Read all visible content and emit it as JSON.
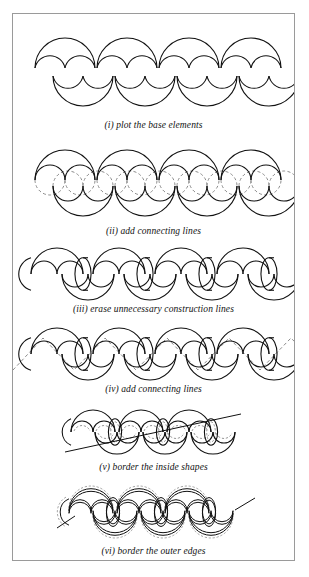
{
  "figure": {
    "background_color": "#ffffff",
    "border_color": "#9a9a9a",
    "solid_line_color": "#000000",
    "dashed_line_color": "#8c8c8c"
  },
  "steps": [
    {
      "id": "i",
      "caption": "(i) plot the base elements",
      "caption_y": 106,
      "panel_y": 16,
      "panel_h": 88,
      "description": "four arch elements on top row and four cup elements on lower row"
    },
    {
      "id": "ii",
      "caption": "(ii) add connecting lines",
      "caption_y": 212,
      "panel_y": 128,
      "panel_h": 82,
      "description": "circles completed with dashed construction arcs"
    },
    {
      "id": "iii",
      "caption": "(iii) erase unnecessary construction lines",
      "caption_y": 290,
      "panel_y": 232,
      "panel_h": 56,
      "description": "interlocking heart and oval shapes joined by short straight links"
    },
    {
      "id": "iv",
      "caption": "(iv) add connecting lines",
      "caption_y": 370,
      "panel_y": 312,
      "panel_h": 56,
      "description": "diagonal dashed zigzag lines crossing the chain"
    },
    {
      "id": "v",
      "caption": "(v) border the inside shapes",
      "caption_y": 448,
      "panel_y": 392,
      "panel_h": 54,
      "description": "inner dashed outlines added inside each loop, diagonal stroke across"
    },
    {
      "id": "vi",
      "caption": "(vi) border the outer edges",
      "caption_y": 532,
      "panel_y": 470,
      "panel_h": 60,
      "description": "thick double-line bands with dashed outer edging"
    }
  ],
  "geometry": {
    "unit": 30,
    "count": 4,
    "start_x": 18,
    "row_gap": 30
  }
}
